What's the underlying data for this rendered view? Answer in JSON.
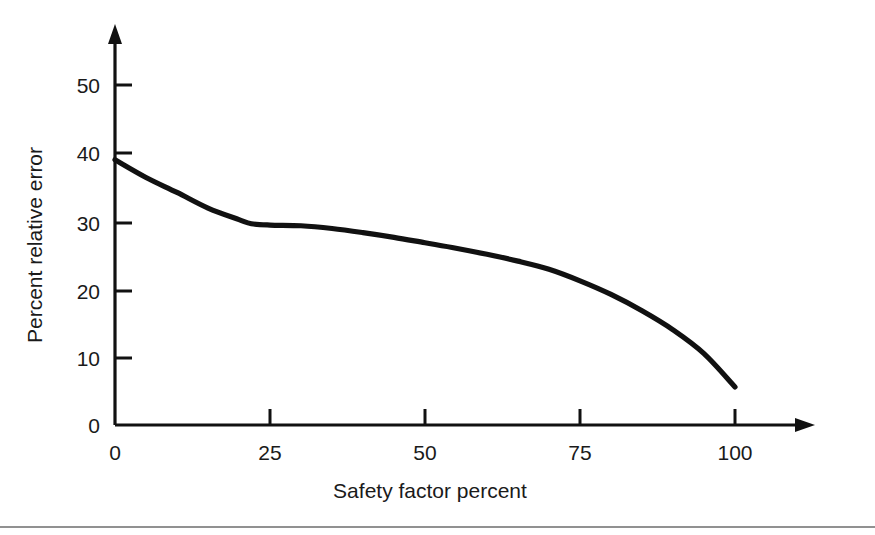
{
  "chart_data": {
    "type": "line",
    "title": "",
    "subtitle": "",
    "xlabel": "Safety factor percent",
    "ylabel": "Percent relative error",
    "xlim": [
      0,
      110
    ],
    "ylim": [
      0,
      57
    ],
    "xticks": [
      0,
      25,
      50,
      75,
      100
    ],
    "xtick_labels": [
      "0",
      "25",
      "50",
      "75",
      "100"
    ],
    "yticks": [
      0,
      10,
      20,
      30,
      40,
      50
    ],
    "ytick_labels": [
      "0",
      "10",
      "20",
      "30",
      "40",
      "50"
    ],
    "grid": false,
    "legend": null,
    "legend_position": "none",
    "axis_style": "arrow-terminated-open-axes",
    "series": [
      {
        "name": "Percent relative error",
        "color": "#111111",
        "x": [
          0,
          5,
          10,
          15,
          20,
          22,
          25,
          30,
          35,
          40,
          45,
          50,
          55,
          60,
          65,
          70,
          75,
          80,
          85,
          90,
          95,
          100
        ],
        "y": [
          39.0,
          36.4,
          34.2,
          31.9,
          30.2,
          29.6,
          29.4,
          29.3,
          28.9,
          28.3,
          27.6,
          26.8,
          26.0,
          25.1,
          24.1,
          22.9,
          21.2,
          19.2,
          16.8,
          14.0,
          10.5,
          5.6
        ]
      }
    ],
    "annotations": []
  },
  "figure": {
    "background_color": "#ffffff",
    "line_color": "#111111",
    "text_color": "#1a1a1a",
    "bottom_rule_color": "#6d6d6d"
  }
}
